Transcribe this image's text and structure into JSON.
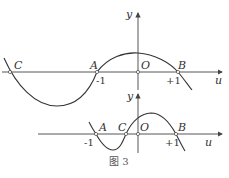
{
  "figure": {
    "caption": "图 3",
    "top_graph": {
      "y_axis_label": "y",
      "x_axis_label": "u",
      "origin_label": "O",
      "points": [
        {
          "label": "C",
          "u": "≈-2.5"
        },
        {
          "label": "A",
          "u": "-1"
        },
        {
          "label": "B",
          "u": "+1"
        }
      ],
      "tick_labels": [
        "-1",
        "+1"
      ],
      "curve": "cubic with zeros at C (left of -1), A (-1), B (+1); local min between C and A; local max near O"
    },
    "bottom_graph": {
      "y_axis_label": "y",
      "x_axis_label": "u",
      "origin_label": "O",
      "points": [
        {
          "label": "A",
          "u": "-1"
        },
        {
          "label": "C",
          "u": "≈-0.3"
        },
        {
          "label": "B",
          "u": "+1"
        }
      ],
      "tick_labels": [
        "-1",
        "+1"
      ],
      "curve": "cubic with zeros at A (-1), C (between -1 and 0), B (+1); local min between A and C; local max between O and B"
    }
  }
}
